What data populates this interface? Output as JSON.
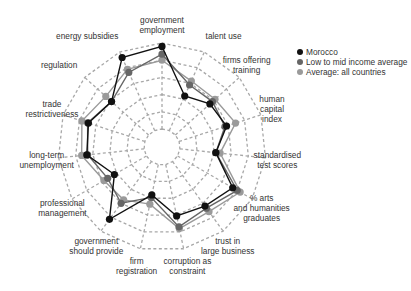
{
  "chart_data": {
    "type": "radar",
    "title": "",
    "axes": [
      {
        "label": [
          "government",
          "employment"
        ]
      },
      {
        "label": [
          "talent use"
        ]
      },
      {
        "label": [
          "firms offering",
          "training"
        ]
      },
      {
        "label": [
          "human",
          "capital",
          "index"
        ]
      },
      {
        "label": [
          "standardised",
          "test scores"
        ]
      },
      {
        "label": [
          "% arts",
          "and humanities",
          "graduates"
        ]
      },
      {
        "label": [
          "trust in",
          "large business"
        ]
      },
      {
        "label": [
          "corruption as",
          "constraint"
        ]
      },
      {
        "label": [
          "firm",
          "registration"
        ]
      },
      {
        "label": [
          "government",
          "should provide"
        ]
      },
      {
        "label": [
          "professional",
          "management"
        ]
      },
      {
        "label": [
          "long-term",
          "unemployment"
        ]
      },
      {
        "label": [
          "trade",
          "restrictiveness"
        ]
      },
      {
        "label": [
          "regulation"
        ]
      },
      {
        "label": [
          "energy subsidies"
        ]
      }
    ],
    "categories": [
      "government employment",
      "talent use",
      "firms offering training",
      "human capital index",
      "standardised test scores",
      "% arts and humanities graduates",
      "trust in large business",
      "corruption as constraint",
      "firm registration",
      "government should provide",
      "professional management",
      "long-term unemployment",
      "trade restrictiveness",
      "regulation",
      "energy subsidies"
    ],
    "rings": 5,
    "range": [
      0,
      1
    ],
    "grid": "dashed",
    "legend_position": "top-right",
    "series": [
      {
        "name": "Morocco",
        "color": "#111111",
        "values": [
          0.96,
          0.44,
          0.54,
          0.58,
          0.42,
          0.74,
          0.64,
          0.61,
          0.36,
          0.83,
          0.43,
          0.67,
          0.69,
          0.58,
          0.93
        ]
      },
      {
        "name": "Low to mid income average",
        "color": "#666666",
        "values": [
          0.87,
          0.58,
          0.58,
          0.56,
          0.42,
          0.8,
          0.67,
          0.74,
          0.39,
          0.6,
          0.52,
          0.66,
          0.7,
          0.58,
          0.74
        ]
      },
      {
        "name": "Average: all countries",
        "color": "#9a9a9a",
        "values": [
          0.8,
          0.63,
          0.62,
          0.69,
          0.47,
          0.84,
          0.72,
          0.76,
          0.47,
          0.55,
          0.57,
          0.73,
          0.77,
          0.67,
          0.78
        ]
      }
    ]
  },
  "legend": {
    "items": [
      {
        "label": "Morocco",
        "color": "#111111"
      },
      {
        "label": "Low to mid income average",
        "color": "#666666"
      },
      {
        "label": "Average: all countries",
        "color": "#9a9a9a"
      }
    ]
  }
}
